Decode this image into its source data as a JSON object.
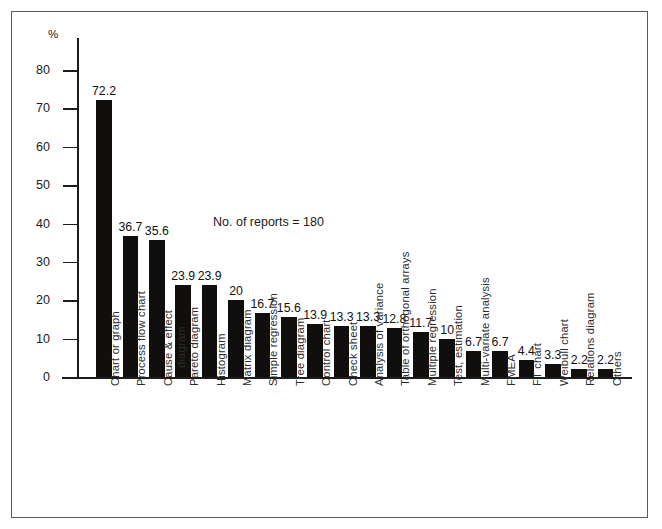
{
  "figure": {
    "background_color": "#ffffff",
    "frame_color": "#5a5a58",
    "bar_color": "#100f0d",
    "axis_color": "#1c1c1c"
  },
  "annotation": "No. of reports = 180",
  "axis": {
    "y_unit_label": "%",
    "y_ticks": [
      "0",
      "10",
      "20",
      "30",
      "40",
      "50",
      "60",
      "70",
      "80"
    ]
  },
  "chart_data": {
    "type": "bar",
    "title": "",
    "subtitle": "",
    "xlabel": "",
    "ylabel": "%",
    "ylim": [
      0,
      80
    ],
    "ytick_step": 10,
    "grid": false,
    "legend": null,
    "annotations": [
      "No. of reports = 180"
    ],
    "categories": [
      "Chart or graph",
      "Process flow chart",
      "Cause & effect diagram",
      "Pareto diagram",
      "Histogram",
      "Matrix diagram",
      "Simple regression",
      "Tree diagram",
      "Control chart",
      "Check sheet",
      "Analysis of variance",
      "Table of orthogonal arrays",
      "Multiple regression",
      "Test, estimation",
      "Multi-variate analysis",
      "FMEA",
      "FT chart",
      "Weibull chart",
      "Relations diagram",
      "Others"
    ],
    "values": [
      72.2,
      36.7,
      35.6,
      23.9,
      23.9,
      20,
      16.7,
      15.6,
      13.9,
      13.3,
      13.3,
      12.8,
      11.7,
      10,
      6.7,
      6.7,
      4.4,
      3.3,
      2.2,
      2.2
    ],
    "value_labels": [
      "72.2",
      "36.7",
      "35.6",
      "23.9",
      "23.9",
      "20",
      "16.7",
      "15.6",
      "13.9",
      "13.3",
      "13.3",
      "12.8",
      "11.7",
      "10",
      "6.7",
      "6.7",
      "4.4",
      "3.3",
      "2.2",
      "2.2"
    ],
    "category_label_lines": [
      [
        "Chart or graph"
      ],
      [
        "Process flow chart"
      ],
      [
        "Cause & effect",
        "diagram"
      ],
      [
        "Pareto diagram"
      ],
      [
        "Histogram"
      ],
      [
        "Matrix diagram"
      ],
      [
        "Simple regression"
      ],
      [
        "Tree diagram"
      ],
      [
        "Control chart"
      ],
      [
        "Check sheet"
      ],
      [
        "Analysis of variance"
      ],
      [
        "Table of orthogonal arrays"
      ],
      [
        "Multiple regression"
      ],
      [
        "Test, estimation"
      ],
      [
        "Multi-variate analysis"
      ],
      [
        "FMEA"
      ],
      [
        "FT chart"
      ],
      [
        "Weibull chart"
      ],
      [
        "Relations diagram"
      ],
      [
        "Others"
      ]
    ]
  }
}
